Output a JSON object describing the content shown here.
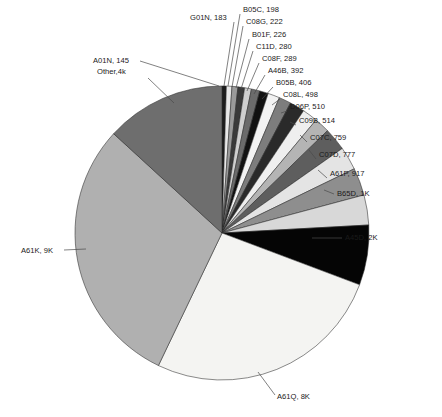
{
  "chart_data": {
    "type": "pie",
    "title": "",
    "subtitle": "",
    "xlabel": "",
    "ylabel": "",
    "legend_position": "none",
    "grid": false,
    "label_format": "{category}, {value_label}",
    "start_angle_deg": 0,
    "direction": "clockwise",
    "categories": [
      "A01N",
      "G01N",
      "B05C",
      "C08G",
      "B01F",
      "C11D",
      "C08F",
      "A46B",
      "B05B",
      "C08L",
      "D06P",
      "C09B",
      "C07C",
      "C07D",
      "A61P",
      "B65D",
      "A45D",
      "A61Q",
      "A61K",
      "Other"
    ],
    "values": [
      145,
      183,
      198,
      222,
      226,
      280,
      289,
      392,
      406,
      498,
      510,
      514,
      759,
      777,
      917,
      1000,
      2000,
      8000,
      9000,
      4000
    ],
    "value_labels": [
      "145",
      "183",
      "198",
      "222",
      "226",
      "280",
      "289",
      "392",
      "406",
      "498",
      "510",
      "514",
      "759",
      "777",
      "917",
      "1K",
      "2K",
      "8K",
      "9K",
      "4k"
    ],
    "slices": [
      {
        "category": "A01N",
        "value": 145,
        "value_label": "145",
        "label": "A01N, 145",
        "color": "#1c1c1c",
        "label_side": "top-left"
      },
      {
        "category": "G01N",
        "value": 183,
        "value_label": "183",
        "label": "G01N, 183",
        "color": "#e8e8e8",
        "label_side": "top-left"
      },
      {
        "category": "B05C",
        "value": 198,
        "value_label": "198",
        "label": "B05C, 198",
        "color": "#9a9a9a",
        "label_side": "top"
      },
      {
        "category": "C08G",
        "value": 222,
        "value_label": "222",
        "label": "C08G, 222",
        "color": "#3a3a3a",
        "label_side": "top"
      },
      {
        "category": "B01F",
        "value": 226,
        "value_label": "226",
        "label": "B01F, 226",
        "color": "#cfcfcf",
        "label_side": "top"
      },
      {
        "category": "C11D",
        "value": 280,
        "value_label": "280",
        "label": "C11D, 280",
        "color": "#6b6b6b",
        "label_side": "top"
      },
      {
        "category": "C08F",
        "value": 289,
        "value_label": "289",
        "label": "C08F, 289",
        "color": "#111111",
        "label_side": "top-right"
      },
      {
        "category": "A46B",
        "value": 392,
        "value_label": "392",
        "label": "A46B, 392",
        "color": "#f2f2f2",
        "label_side": "top-right"
      },
      {
        "category": "B05B",
        "value": 406,
        "value_label": "406",
        "label": "B05B, 406",
        "color": "#7d7d7d",
        "label_side": "top-right"
      },
      {
        "category": "C08L",
        "value": 498,
        "value_label": "498",
        "label": "C08L, 498",
        "color": "#2a2a2a",
        "label_side": "right"
      },
      {
        "category": "D06P",
        "value": 510,
        "value_label": "510",
        "label": "D06P, 510",
        "color": "#efefef",
        "label_side": "right"
      },
      {
        "category": "C09B",
        "value": 514,
        "value_label": "514",
        "label": "C09B, 514",
        "color": "#b4b4b4",
        "label_side": "right"
      },
      {
        "category": "C07C",
        "value": 759,
        "value_label": "759",
        "label": "C07C, 759",
        "color": "#5e5e5e",
        "label_side": "right"
      },
      {
        "category": "C07D",
        "value": 777,
        "value_label": "777",
        "label": "C07D, 777",
        "color": "#e4e4e4",
        "label_side": "right"
      },
      {
        "category": "A61P",
        "value": 917,
        "value_label": "917",
        "label": "A61P, 917",
        "color": "#8e8e8e",
        "label_side": "right"
      },
      {
        "category": "B65D",
        "value": 1000,
        "value_label": "1K",
        "label": "B65D, 1K",
        "color": "#d8d8d8",
        "label_side": "right"
      },
      {
        "category": "A45D",
        "value": 2000,
        "value_label": "2K",
        "label": "A45D, 2K",
        "color": "#050505",
        "label_side": "right"
      },
      {
        "category": "A61Q",
        "value": 8000,
        "value_label": "8K",
        "label": "A61Q, 8K",
        "color": "#f4f4f2",
        "label_side": "bottom"
      },
      {
        "category": "A61K",
        "value": 9000,
        "value_label": "9K",
        "label": "A61K, 9K",
        "color": "#b0b0b0",
        "label_side": "left"
      },
      {
        "category": "Other",
        "value": 4000,
        "value_label": "4k",
        "label": "Other,4k",
        "color": "#6e6e6e",
        "label_side": "top-left"
      }
    ]
  },
  "labels": [
    {
      "name": "slice-label-b05c",
      "text": "B05C, 198",
      "x": 243,
      "y": 12,
      "anchor": "start",
      "lx1": 240,
      "ly1": 14,
      "lx2": 228,
      "ly2": 86
    },
    {
      "name": "slice-label-c08g",
      "text": "C08G, 222",
      "x": 246,
      "y": 24,
      "anchor": "start",
      "lx1": 243,
      "ly1": 26,
      "lx2": 232,
      "ly2": 87
    },
    {
      "name": "slice-label-g01n",
      "text": "G01N, 183",
      "x": 190,
      "y": 20,
      "anchor": "start",
      "lx1": 234,
      "ly1": 22,
      "lx2": 224,
      "ly2": 86
    },
    {
      "name": "slice-label-b01f",
      "text": "B01F, 226",
      "x": 252,
      "y": 37,
      "anchor": "start",
      "lx1": 249,
      "ly1": 39,
      "lx2": 236,
      "ly2": 88
    },
    {
      "name": "slice-label-c11d",
      "text": "C11D, 280",
      "x": 256,
      "y": 49,
      "anchor": "start",
      "lx1": 253,
      "ly1": 51,
      "lx2": 241,
      "ly2": 89
    },
    {
      "name": "slice-label-c08f",
      "text": "C08F, 289",
      "x": 262,
      "y": 61,
      "anchor": "start",
      "lx1": 259,
      "ly1": 63,
      "lx2": 247,
      "ly2": 91
    },
    {
      "name": "slice-label-a46b",
      "text": "A46B, 392",
      "x": 268,
      "y": 73,
      "anchor": "start",
      "lx1": 265,
      "ly1": 75,
      "lx2": 254,
      "ly2": 94
    },
    {
      "name": "slice-label-b05b",
      "text": "B05B, 406",
      "x": 276,
      "y": 85,
      "anchor": "start",
      "lx1": 273,
      "ly1": 87,
      "lx2": 262,
      "ly2": 99
    },
    {
      "name": "slice-label-c08l",
      "text": "C08L, 498",
      "x": 283,
      "y": 97,
      "anchor": "start",
      "lx1": 280,
      "ly1": 99,
      "lx2": 272,
      "ly2": 105
    },
    {
      "name": "slice-label-d06p",
      "text": "D06P, 510",
      "x": 290,
      "y": 109,
      "anchor": "start",
      "lx1": 287,
      "ly1": 111,
      "lx2": 281,
      "ly2": 113
    },
    {
      "name": "slice-label-c09b",
      "text": "C09B, 514",
      "x": 299,
      "y": 123,
      "anchor": "start",
      "lx1": 296,
      "ly1": 125,
      "lx2": 290,
      "ly2": 122
    },
    {
      "name": "slice-label-c07c",
      "text": "C07C, 759",
      "x": 310,
      "y": 140,
      "anchor": "start",
      "lx1": 307,
      "ly1": 142,
      "lx2": 300,
      "ly2": 135
    },
    {
      "name": "slice-label-c07d",
      "text": "C07D, 777",
      "x": 319,
      "y": 157,
      "anchor": "start",
      "lx1": 316,
      "ly1": 159,
      "lx2": 309,
      "ly2": 150
    },
    {
      "name": "slice-label-a61p",
      "text": "A61P, 917",
      "x": 330,
      "y": 176,
      "anchor": "start",
      "lx1": 327,
      "ly1": 178,
      "lx2": 318,
      "ly2": 170
    },
    {
      "name": "slice-label-b65d",
      "text": "B65D, 1K",
      "x": 337,
      "y": 196,
      "anchor": "start",
      "lx1": 334,
      "ly1": 194,
      "lx2": 324,
      "ly2": 190
    },
    {
      "name": "slice-label-a45d",
      "text": "A45D, 2K",
      "x": 345,
      "y": 240,
      "anchor": "start",
      "lx1": 342,
      "ly1": 238,
      "lx2": 312,
      "ly2": 238
    },
    {
      "name": "slice-label-a01n",
      "text": "A01N, 145",
      "x": 93,
      "y": 63,
      "anchor": "start",
      "lx1": 140,
      "ly1": 61,
      "lx2": 219,
      "ly2": 86
    },
    {
      "name": "slice-label-other",
      "text": "Other,4k",
      "x": 97,
      "y": 74,
      "anchor": "start",
      "lx1": 148,
      "ly1": 78,
      "lx2": 174,
      "ly2": 103
    },
    {
      "name": "slice-label-a61k",
      "text": "A61K, 9K",
      "x": 21,
      "y": 253,
      "anchor": "start",
      "lx1": 64,
      "ly1": 250,
      "lx2": 86,
      "ly2": 249
    },
    {
      "name": "slice-label-a61q",
      "text": "A61Q, 8K",
      "x": 277,
      "y": 399,
      "anchor": "start",
      "lx1": 275,
      "ly1": 395,
      "lx2": 258,
      "ly2": 372
    }
  ],
  "geometry": {
    "cx": 222,
    "cy": 233,
    "r": 147
  }
}
